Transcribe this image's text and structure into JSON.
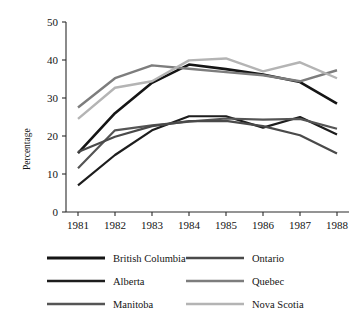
{
  "chart_data": {
    "type": "line",
    "title": "",
    "subtitle": "",
    "xlabel": "",
    "ylabel": "Percentage",
    "x": [
      "1981",
      "1982",
      "1983",
      "1984",
      "1985",
      "1986",
      "1987",
      "1988"
    ],
    "xtick_labels": [
      "1981",
      "1982",
      "1983",
      "1984",
      "1985",
      "1986",
      "1987",
      "1988"
    ],
    "ytick_labels": [
      "0",
      "10",
      "20",
      "30",
      "40",
      "50"
    ],
    "ytick_values": [
      0,
      10,
      20,
      30,
      40,
      50
    ],
    "ylim": [
      0,
      50
    ],
    "grid": false,
    "legend_position": "below-plot",
    "legend_columns": 2,
    "series": [
      {
        "name": "British Columbia",
        "color": "#151515",
        "width": 2.6,
        "values": [
          15.5,
          26.0,
          34.0,
          38.8,
          37.6,
          36.2,
          34.2,
          28.5
        ]
      },
      {
        "name": "Alberta",
        "color": "#1d1d1d",
        "width": 2.2,
        "values": [
          7.0,
          15.0,
          21.5,
          25.2,
          25.2,
          22.2,
          25.0,
          20.4
        ]
      },
      {
        "name": "Manitoba",
        "color": "#555555",
        "width": 2.2,
        "values": [
          11.5,
          21.5,
          22.8,
          23.8,
          24.6,
          24.3,
          24.5,
          21.9
        ]
      },
      {
        "name": "Ontario",
        "color": "#4a4a4a",
        "width": 2.2,
        "values": [
          15.8,
          19.8,
          22.6,
          23.9,
          24.0,
          22.6,
          20.2,
          15.4
        ]
      },
      {
        "name": "Quebec",
        "color": "#7d7d7d",
        "width": 2.4,
        "values": [
          27.5,
          35.2,
          38.6,
          37.7,
          36.8,
          36.0,
          34.4,
          37.3
        ]
      },
      {
        "name": "Nova Scotia",
        "color": "#b4b4b4",
        "width": 2.4,
        "values": [
          24.5,
          32.7,
          34.4,
          39.9,
          40.4,
          37.0,
          39.4,
          35.2
        ]
      }
    ]
  },
  "legend": {
    "entries": [
      {
        "label": "British Columbia",
        "color": "#151515",
        "width": 3.0
      },
      {
        "label": "Ontario",
        "color": "#4a4a4a",
        "width": 2.4
      },
      {
        "label": "Alberta",
        "color": "#1d1d1d",
        "width": 2.6
      },
      {
        "label": "Quebec",
        "color": "#7d7d7d",
        "width": 2.6
      },
      {
        "label": "Manitoba",
        "color": "#555555",
        "width": 2.6
      },
      {
        "label": "Nova Scotia",
        "color": "#b4b4b4",
        "width": 2.6
      }
    ]
  }
}
